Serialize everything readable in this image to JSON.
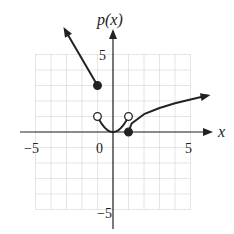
{
  "chart_data": {
    "type": "line",
    "title": "",
    "xlabel": "x",
    "ylabel": "p(x)",
    "xlim": [
      -5,
      5
    ],
    "ylim": [
      -5,
      5
    ],
    "grid": true,
    "x_ticks": [
      {
        "value": -5,
        "label": "−5"
      },
      {
        "value": 0,
        "label": "0"
      },
      {
        "value": 5,
        "label": "5"
      }
    ],
    "y_ticks": [
      {
        "value": 5,
        "label": "5"
      },
      {
        "value": -5,
        "label": "−5"
      }
    ],
    "series": [
      {
        "name": "left ray",
        "description": "line for x <= -1, arrow continuing up-left",
        "points": [
          [
            -1,
            3
          ],
          [
            -3.1,
            6.6
          ]
        ],
        "endpoint": {
          "x": -1,
          "y": 3,
          "closed": true
        }
      },
      {
        "name": "parabola",
        "description": "p(x)=x^2 for -1<x<1",
        "points": [
          [
            -1,
            1
          ],
          [
            -0.5,
            0.25
          ],
          [
            0,
            0
          ],
          [
            0.5,
            0.25
          ],
          [
            1,
            1
          ]
        ],
        "open_endpoints": [
          [
            -1,
            1
          ],
          [
            1,
            1
          ]
        ]
      },
      {
        "name": "right curve",
        "description": "increasing root-like curve for x >= 1, arrow to the right",
        "points": [
          [
            1,
            0
          ],
          [
            1.2,
            0.55
          ],
          [
            2,
            1.15
          ],
          [
            3,
            1.55
          ],
          [
            4,
            1.85
          ],
          [
            5,
            2.1
          ],
          [
            6.1,
            2.35
          ]
        ],
        "endpoint": {
          "x": 1,
          "y": 0,
          "closed": true
        }
      }
    ]
  },
  "labels": {
    "y_axis": "p(x)",
    "x_axis": "x",
    "tick_x_neg5": "−5",
    "tick_x_0": "0",
    "tick_x_5": "5",
    "tick_y_5": "5",
    "tick_y_neg5": "−5"
  }
}
